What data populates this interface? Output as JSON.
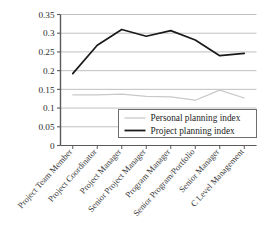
{
  "chart_data": {
    "type": "line",
    "title": "",
    "xlabel": "",
    "ylabel": "",
    "ylim": [
      0,
      0.35
    ],
    "ytick_labels": [
      "0",
      "0.05",
      "0.1",
      "0.15",
      "0.2",
      "0.25",
      "0.3",
      "0.35"
    ],
    "ytick_values": [
      0,
      0.05,
      0.1,
      0.15,
      0.2,
      0.25,
      0.3,
      0.35
    ],
    "grid": true,
    "grid_axis": "y",
    "legend_position": "lower-right-inside",
    "categories": [
      "Project Team Member",
      "Project Coordinator",
      "Project Manager",
      "Senior Project Manager",
      "Program Manager",
      "Senior Program/Portfolio",
      "Senior Manager",
      "C Level Management"
    ],
    "series": [
      {
        "name": "Personal planning index",
        "color": "#c9c9c9",
        "values": [
          0.135,
          0.135,
          0.137,
          0.131,
          0.13,
          0.121,
          0.148,
          0.127
        ]
      },
      {
        "name": "Project planning index",
        "color": "#1a1a1a",
        "values": [
          0.192,
          0.268,
          0.31,
          0.292,
          0.307,
          0.282,
          0.24,
          0.246
        ]
      }
    ]
  },
  "legend": {
    "entries": [
      {
        "label": "Personal planning index"
      },
      {
        "label": "Project planning index"
      }
    ]
  },
  "colors": {
    "axis": "#5a5a5a",
    "grid": "#b9b9b9",
    "personal_line": "#c9c9c9",
    "project_line": "#1a1a1a",
    "text": "#2b2b2b",
    "legend_border": "#6e6e6e",
    "background": "#ffffff"
  }
}
